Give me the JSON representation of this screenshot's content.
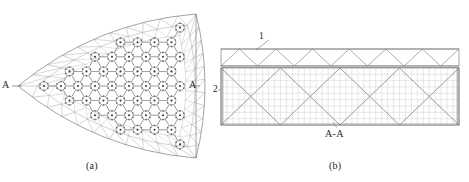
{
  "figure": {
    "background_color": "#ffffff",
    "line_color": "#9a9a9a",
    "dark_line_color": "#6b6b6b",
    "text_color": "#2a2a2a",
    "panels": [
      {
        "id": "a",
        "caption": "(a)",
        "description": "plan-view curved-triangle space-frame lattice",
        "section_markers": [
          {
            "label": "A",
            "position": "left"
          },
          {
            "label": "A",
            "position": "right"
          }
        ]
      },
      {
        "id": "b",
        "caption": "(b)",
        "description": "section A-A elevation of truss and braced grid",
        "section_title": "A-A",
        "callouts": [
          {
            "label": "1",
            "target": "upper-zigzag-truss"
          },
          {
            "label": "2",
            "target": "lower-braced-grid"
          }
        ]
      }
    ],
    "captions": {
      "panel_a": "(a)",
      "panel_b": "(b)"
    },
    "labels": {
      "marker_a_left": "A",
      "marker_a_right": "A",
      "callout_one": "1",
      "callout_two": "2",
      "section_title": "A-A"
    }
  },
  "chart_data": {
    "type": "diagram",
    "title": "",
    "panel_a": {
      "shape": "reuleaux-like curved triangle",
      "apex_points": [
        [
          18,
          86
        ],
        [
          196,
          14
        ],
        [
          196,
          158
        ]
      ],
      "lattice": {
        "kind": "triangular-hexagonal space frame",
        "ring_rows": 10,
        "ring_columns": 9,
        "ring_radius": 4.4,
        "cell_pitch_x": 17.0,
        "cell_pitch_y": 14.6
      }
    },
    "panel_b": {
      "upper_truss": {
        "kind": "zigzag warren truss",
        "bays": 13,
        "height": 17,
        "x_start": 9,
        "x_end": 247
      },
      "lower_grid": {
        "kind": "braced orthogonal grid",
        "x_braced_bays": 4,
        "grid_columns": 40,
        "grid_rows": 9,
        "height": 57
      }
    }
  }
}
